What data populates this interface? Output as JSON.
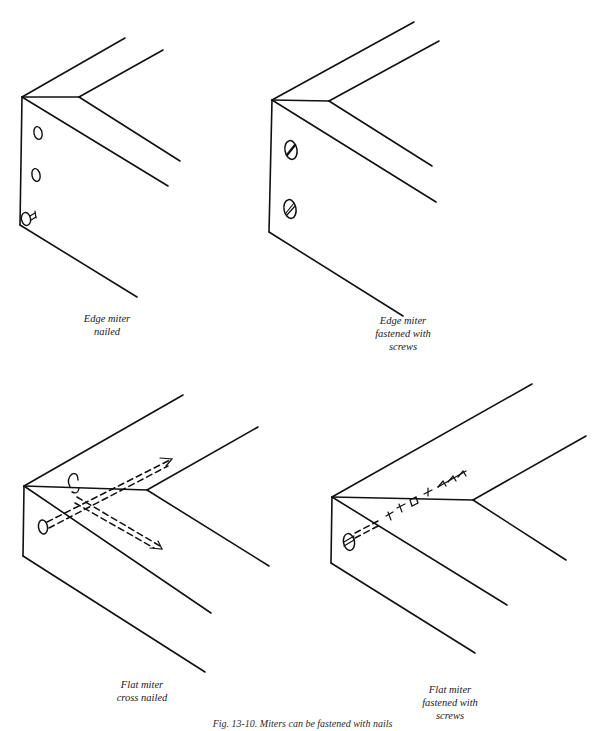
{
  "figure": {
    "caption": "Fig. 13-10. Miters can be fastened with nails or screws.",
    "caption_visible_fragment": "Fig. 13-10. Miters can be fastened with nails",
    "panels": [
      {
        "id": "edge-miter-nailed",
        "label_lines": [
          "Edge miter",
          "nailed"
        ],
        "fasteners": "nails",
        "fastener_icon": "nail-head-icon"
      },
      {
        "id": "edge-miter-screws",
        "label_lines": [
          "Edge miter",
          "fastened with",
          "screws"
        ],
        "fasteners": "screws",
        "fastener_icon": "slotted-screw-icon"
      },
      {
        "id": "flat-miter-cross-nailed",
        "label_lines": [
          "Flat miter",
          "cross nailed"
        ],
        "fasteners": "nails (hidden, dashed)",
        "fastener_icon": "nail-icon"
      },
      {
        "id": "flat-miter-screws",
        "label_lines": [
          "Flat miter",
          "fastened with",
          "screws"
        ],
        "fasteners": "screw (hidden, dashed)",
        "fastener_icon": "slotted-screw-icon"
      }
    ]
  },
  "colors": {
    "ink": "#111111",
    "background": "#ffffff"
  }
}
